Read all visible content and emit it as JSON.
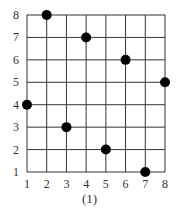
{
  "chart_data": {
    "type": "scatter",
    "title": "",
    "caption": "(1)",
    "xlabel": "",
    "ylabel": "",
    "x_ticks": [
      1,
      2,
      3,
      4,
      5,
      6,
      7,
      8
    ],
    "y_ticks": [
      1,
      2,
      3,
      4,
      5,
      6,
      7,
      8
    ],
    "xlim": [
      1,
      8
    ],
    "ylim": [
      1,
      8
    ],
    "grid": true,
    "points": [
      {
        "x": 1,
        "y": 4
      },
      {
        "x": 2,
        "y": 8
      },
      {
        "x": 3,
        "y": 3
      },
      {
        "x": 4,
        "y": 7
      },
      {
        "x": 5,
        "y": 2
      },
      {
        "x": 6,
        "y": 6
      },
      {
        "x": 7,
        "y": 1
      },
      {
        "x": 8,
        "y": 5
      }
    ],
    "colors": {
      "grid": "#333333",
      "point": "#000000",
      "text": "#333333"
    }
  }
}
